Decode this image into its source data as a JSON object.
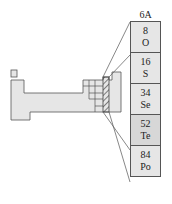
{
  "diagram": {
    "group_label": "6A",
    "elements": [
      {
        "number": "8",
        "symbol": "O"
      },
      {
        "number": "16",
        "symbol": "S"
      },
      {
        "number": "34",
        "symbol": "Se"
      },
      {
        "number": "52",
        "symbol": "Te"
      },
      {
        "number": "84",
        "symbol": "Po"
      }
    ],
    "colors": {
      "fill": "#e6e6e6",
      "highlight_fill": "#d7d7d7",
      "stroke": "#555555"
    }
  }
}
